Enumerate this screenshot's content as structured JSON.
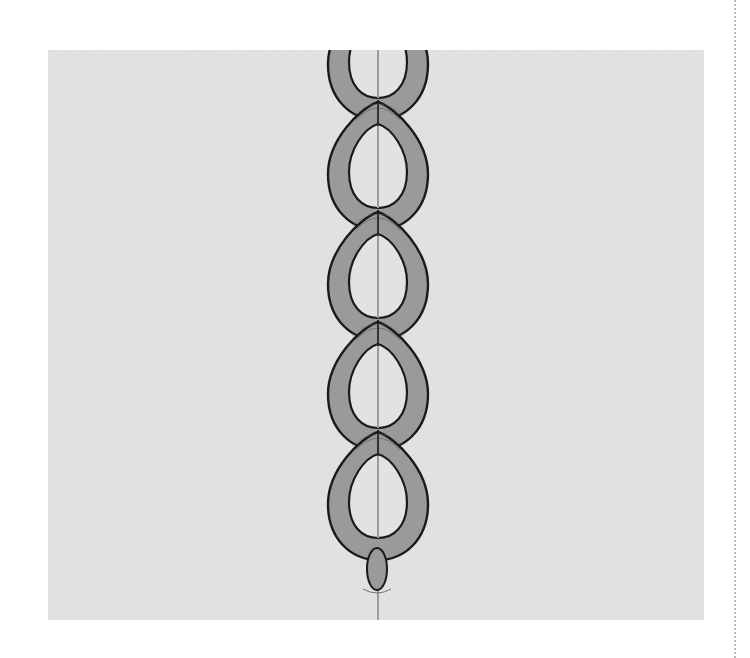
{
  "figure": {
    "title": "Chain stitch diagram",
    "colors": {
      "background": "#ffffff",
      "panel": "#e2e2e2",
      "link_fill": "#9a9a9a",
      "link_outline": "#1a1a1a",
      "thread_line": "#9c9c9c",
      "dotted_rule": "#b8b8b8"
    },
    "panel": {
      "x": 48,
      "y": 50,
      "width": 656,
      "height": 570
    },
    "thread": {
      "x": 378,
      "y1": 50,
      "y2": 620
    },
    "links": [
      {
        "index": 0,
        "junction_y": -8,
        "partial": true
      },
      {
        "index": 1,
        "junction_y": 102
      },
      {
        "index": 2,
        "junction_y": 212
      },
      {
        "index": 3,
        "junction_y": 322
      },
      {
        "index": 4,
        "junction_y": 432
      }
    ],
    "tack_stitch": {
      "cx": 377,
      "cy": 569,
      "rx": 10,
      "ry": 21
    },
    "link_count_full": 5
  }
}
